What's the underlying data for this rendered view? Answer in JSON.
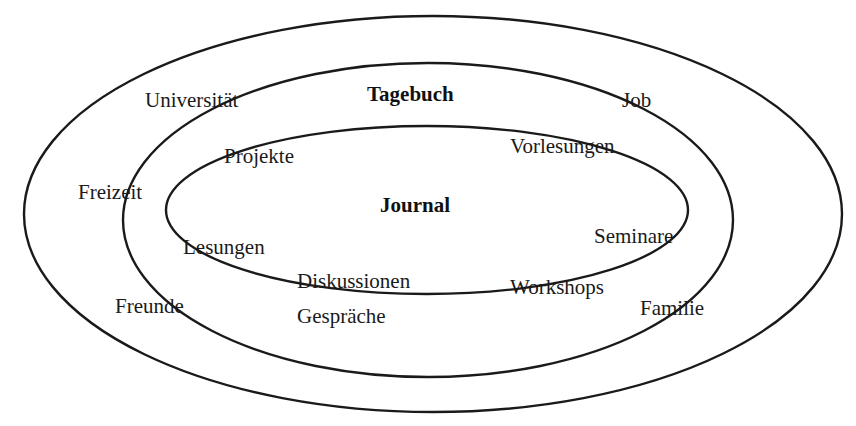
{
  "diagram": {
    "type": "nested-ellipses",
    "rings": [
      {
        "id": "outer",
        "cx": 433,
        "cy": 214,
        "rx": 409,
        "ry": 198,
        "label": ""
      },
      {
        "id": "middle",
        "cx": 428,
        "cy": 220,
        "rx": 305,
        "ry": 157,
        "label": "Tagebuch"
      },
      {
        "id": "inner",
        "cx": 427,
        "cy": 210,
        "rx": 261,
        "ry": 84,
        "label": "Journal"
      }
    ],
    "titles": {
      "middle": "Tagebuch",
      "inner": "Journal"
    },
    "labels": {
      "universitaet": "Universität",
      "job": "Job",
      "projekte": "Projekte",
      "vorlesungen": "Vorlesungen",
      "freizeit": "Freizeit",
      "seminare": "Seminare",
      "lesungen": "Lesungen",
      "diskussionen": "Diskussionen",
      "workshops": "Workshops",
      "freunde": "Freunde",
      "gespraeche": "Gespräche",
      "familie": "Familie"
    }
  }
}
